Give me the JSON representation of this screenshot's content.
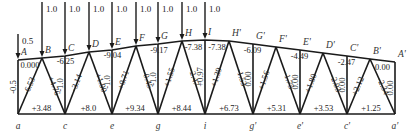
{
  "diagram": {
    "type": "roof-truss-member-forces",
    "top_nodes": [
      {
        "name": "A",
        "x": 18,
        "y": 60
      },
      {
        "name": "B",
        "x": 42,
        "y": 58
      },
      {
        "name": "C",
        "x": 65,
        "y": 56
      },
      {
        "name": "D",
        "x": 89,
        "y": 52
      },
      {
        "name": "E",
        "x": 112,
        "y": 50
      },
      {
        "name": "F",
        "x": 136,
        "y": 46
      },
      {
        "name": "G",
        "x": 158,
        "y": 44
      },
      {
        "name": "H",
        "x": 182,
        "y": 41
      },
      {
        "name": "I",
        "x": 205,
        "y": 40
      },
      {
        "name": "H'",
        "x": 229,
        "y": 41
      },
      {
        "name": "G'",
        "x": 253,
        "y": 44
      },
      {
        "name": "F'",
        "x": 276,
        "y": 47
      },
      {
        "name": "E'",
        "x": 300,
        "y": 50
      },
      {
        "name": "D'",
        "x": 323,
        "y": 53
      },
      {
        "name": "C'",
        "x": 347,
        "y": 56
      },
      {
        "name": "B'",
        "x": 370,
        "y": 59
      },
      {
        "name": "A'",
        "x": 395,
        "y": 62
      }
    ],
    "bottom_nodes": [
      {
        "name": "a",
        "x": 18
      },
      {
        "name": "c",
        "x": 65
      },
      {
        "name": "e",
        "x": 112
      },
      {
        "name": "g",
        "x": 158
      },
      {
        "name": "i",
        "x": 205
      },
      {
        "name": "g'",
        "x": 253
      },
      {
        "name": "e'",
        "x": 300
      },
      {
        "name": "c'",
        "x": 347
      },
      {
        "name": "a'",
        "x": 395
      }
    ],
    "bottom_y": 114,
    "loads": [
      {
        "node": "A",
        "value": "0.5"
      },
      {
        "node": "B",
        "value": "1.0"
      },
      {
        "node": "C",
        "value": "1.0"
      },
      {
        "node": "D",
        "value": "1.0"
      },
      {
        "node": "E",
        "value": "1.0"
      },
      {
        "node": "F",
        "value": "1.0"
      },
      {
        "node": "G",
        "value": "1.0"
      },
      {
        "node": "H",
        "value": "1.0"
      },
      {
        "node": "I",
        "value": "1.0"
      }
    ],
    "top_chord_forces": [
      {
        "member": "AB",
        "value": "0.000"
      },
      {
        "member": "BD",
        "value": "-6.25"
      },
      {
        "member": "DF",
        "value": "-9.04"
      },
      {
        "member": "FH",
        "value": "-9.17"
      },
      {
        "member": "HI",
        "value": "-7.38"
      },
      {
        "member": "IH'",
        "value": "-7.38"
      },
      {
        "member": "H'F'",
        "value": "-6.09"
      },
      {
        "member": "F'D'",
        "value": "-4.49"
      },
      {
        "member": "D'B'",
        "value": "-2.47"
      },
      {
        "member": "B'A'",
        "value": "0.00"
      }
    ],
    "bottom_chord_forces": [
      {
        "member": "ac",
        "value": "+3.48"
      },
      {
        "member": "ce",
        "value": "+8.0"
      },
      {
        "member": "eg",
        "value": "+9.34"
      },
      {
        "member": "gi",
        "value": "+8.44"
      },
      {
        "member": "ig'",
        "value": "+6.73"
      },
      {
        "member": "g'e'",
        "value": "+5.31"
      },
      {
        "member": "e'c'",
        "value": "+3.53"
      },
      {
        "member": "c'a'",
        "value": "+1.25"
      }
    ],
    "web_forces": [
      {
        "member": "Aa",
        "value": "-0.5"
      },
      {
        "member": "aB",
        "value": "-6.53"
      },
      {
        "member": "Bc",
        "value": "+4.76"
      },
      {
        "member": "Cc",
        "value": "-1.0"
      },
      {
        "member": "cD",
        "value": "-3.14"
      },
      {
        "member": "De",
        "value": "+1.90"
      },
      {
        "member": "Ee",
        "value": "-1.0"
      },
      {
        "member": "eF",
        "value": "+0.71"
      },
      {
        "member": "Fg",
        "value": "-0.45"
      },
      {
        "member": "Gg",
        "value": "-1.0"
      },
      {
        "member": "gH",
        "value": "+1.55"
      },
      {
        "member": "Hi",
        "value": "-2.47"
      },
      {
        "member": "Ii",
        "value": "+0.97"
      },
      {
        "member": "iH'",
        "value": "+1.39"
      },
      {
        "member": "H'g'",
        "value": "-1.53"
      },
      {
        "member": "G'g'",
        "value": "0.00"
      },
      {
        "member": "g'F'",
        "value": "+1.56"
      },
      {
        "member": "F'e'",
        "value": "-1.75"
      },
      {
        "member": "E'e'",
        "value": "0.00"
      },
      {
        "member": "e'D'",
        "value": "+1.80"
      },
      {
        "member": "D'c'",
        "value": "-2.03"
      },
      {
        "member": "C'c'",
        "value": "0.00"
      },
      {
        "member": "c'B'",
        "value": "+2.12"
      },
      {
        "member": "B'a'",
        "value": "-2.34"
      },
      {
        "member": "A'a'",
        "value": "0.00"
      }
    ]
  }
}
